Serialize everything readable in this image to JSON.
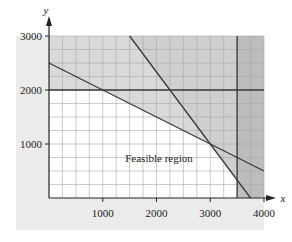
{
  "chart_data": {
    "type": "line",
    "title": "",
    "xlabel": "x",
    "ylabel": "y",
    "xlim": [
      0,
      4000
    ],
    "ylim": [
      0,
      3000
    ],
    "x_ticks": [
      1000,
      2000,
      3000,
      4000
    ],
    "y_ticks": [
      1000,
      2000,
      3000
    ],
    "x_tick_labels": [
      "1000",
      "2000",
      "3000",
      "4000"
    ],
    "y_tick_labels": [
      "1000",
      "2000",
      "3000"
    ],
    "grid": true,
    "grid_step": 250,
    "series": [
      {
        "name": "x + 2y = 5000",
        "points": [
          [
            0,
            2500
          ],
          [
            4000,
            500
          ]
        ]
      },
      {
        "name": "4x + 3y = 15000",
        "points": [
          [
            1500,
            3000
          ],
          [
            3750,
            0
          ]
        ]
      },
      {
        "name": "y = 2000",
        "points": [
          [
            0,
            2000
          ],
          [
            4000,
            2000
          ]
        ]
      },
      {
        "name": "x = 3500",
        "points": [
          [
            3500,
            0
          ],
          [
            3500,
            3000
          ]
        ]
      }
    ],
    "shaded_regions": [
      {
        "name": "y > 2000",
        "shade": "light-gray"
      },
      {
        "name": "x + 2y > 5000",
        "shade": "light-gray"
      },
      {
        "name": "4x + 3y > 15000",
        "shade": "light-gray"
      },
      {
        "name": "x > 3500",
        "shade": "gray"
      }
    ],
    "feasible_vertices": [
      [
        0,
        0
      ],
      [
        0,
        2000
      ],
      [
        1000,
        2000
      ],
      [
        3000,
        1000
      ],
      [
        3375,
        500
      ],
      [
        3500,
        333
      ]
    ],
    "annotations": [
      {
        "text": "Feasible region",
        "x": 2050,
        "y": 700
      }
    ],
    "colors": {
      "panel": "#ebebeb",
      "feasible": "#ffffff",
      "shade_light": "#d9d9d9",
      "shade_dark": "#b5b5b5",
      "grid": "#a8a8a8",
      "line": "#3a3a3a"
    }
  }
}
